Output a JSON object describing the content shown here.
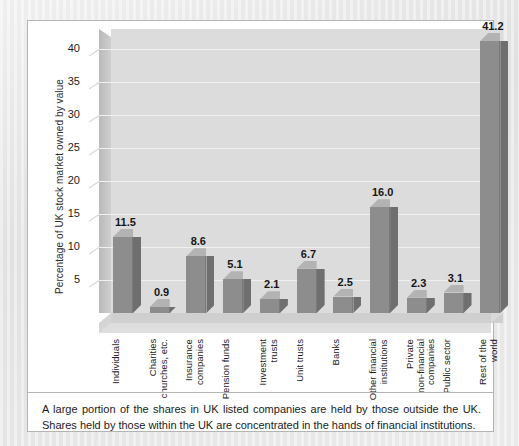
{
  "chart_data": {
    "type": "bar",
    "title": "",
    "xlabel": "",
    "ylabel": "Percentage of UK stock market owned by value",
    "ylim": [
      0,
      43
    ],
    "yticks": [
      5,
      10,
      15,
      20,
      25,
      30,
      35,
      40
    ],
    "grid": true,
    "legend_position": "none",
    "style": "3d-column",
    "categories": [
      "Individuals",
      "Charities\nchurches, etc.",
      "Insurance\ncompanies",
      "Pension funds",
      "Investment\ntrusts",
      "Unit trusts",
      "Banks",
      "Other financial\ninstitutions",
      "Private\nnon-financial\ncompanies",
      "Public sector",
      "Rest of the\nworld"
    ],
    "values": [
      11.5,
      0.9,
      8.6,
      5.1,
      2.1,
      6.7,
      2.5,
      16.0,
      2.3,
      3.1,
      41.2
    ],
    "value_labels": [
      "11.5",
      "0.9",
      "8.6",
      "5.1",
      "2.1",
      "6.7",
      "2.5",
      "16.0",
      "2.3",
      "3.1",
      "41.2"
    ]
  },
  "caption": {
    "text": "A large portion of the shares in UK listed companies are held by those outside the UK. Shares held by those within the UK are concentrated in the hands of financial institutions."
  },
  "colors": {
    "bar_front": "#8d8d8d",
    "bar_side": "#6f6f6f",
    "bar_top": "#b3b3b3",
    "wall_back": "#dcdcdc",
    "panel_background": "#ffffff",
    "page_background": "#e9e9e9",
    "text": "#1b1b1b"
  }
}
